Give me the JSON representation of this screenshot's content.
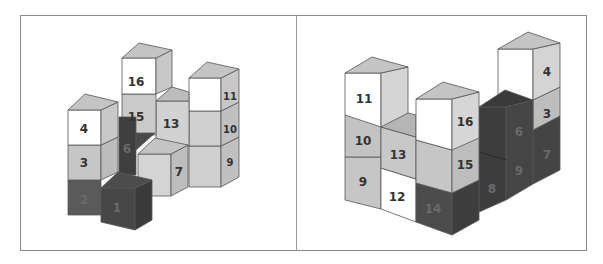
{
  "colors": {
    "white": "#ffffff",
    "light": "#d0d0d0",
    "mid": "#bdbdbd",
    "top": "#c4c4c4",
    "side": "#b0b0b0",
    "dark": "#4a4a4a",
    "darker": "#3a3a3a",
    "edge": "#555555",
    "frame": "#8a8a8a"
  },
  "left_figure": {
    "labels": {
      "c1": "1",
      "c2": "2",
      "c3": "3",
      "c4": "4",
      "c6": "6",
      "c7": "7",
      "c9": "9",
      "c10": "10",
      "c11": "11",
      "c13": "13",
      "c15": "15",
      "c16": "16"
    }
  },
  "right_figure": {
    "labels": {
      "c3": "3",
      "c4": "4",
      "c6": "6",
      "c7": "7",
      "c8": "8",
      "c9": "9",
      "c10": "10",
      "c11": "11",
      "c12": "12",
      "c13": "13",
      "c14": "14",
      "c15": "15",
      "c16": "16"
    }
  }
}
